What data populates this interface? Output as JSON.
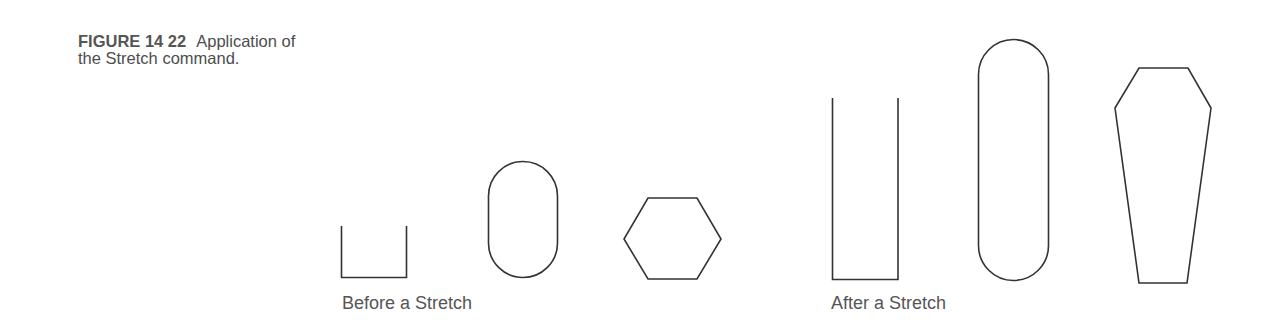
{
  "figure": {
    "number": "FIGURE 14 22",
    "caption_line1": "Application of",
    "caption_line2": "the Stretch command."
  },
  "panels": {
    "before": {
      "label": "Before a Stretch",
      "shapes": [
        "open-rectangle",
        "obround",
        "hexagon"
      ]
    },
    "after": {
      "label": "After a Stretch",
      "shapes": [
        "tall-open-rectangle",
        "tall-obround",
        "stretched-hexagon"
      ]
    }
  },
  "colors": {
    "stroke": "#333333",
    "text": "#555555",
    "background": "#ffffff"
  }
}
